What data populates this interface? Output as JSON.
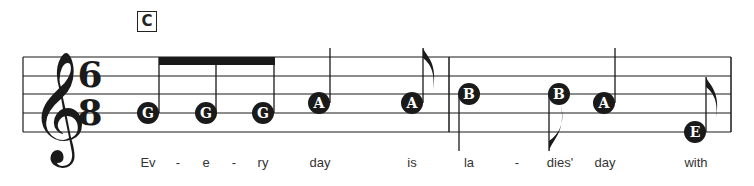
{
  "rehearsal_mark": "C",
  "clef": "treble",
  "time_signature": {
    "top": "6",
    "bottom": "8"
  },
  "colors": {
    "ink": "#1a1a1a",
    "note_text": "#ffffff",
    "lyric": "#333333"
  },
  "measures": [
    {
      "notes": [
        {
          "letter": "G",
          "duration": "eighth",
          "beamed": true,
          "x": 148,
          "y": 113,
          "lyric": "Ev"
        },
        {
          "letter": "G",
          "duration": "eighth",
          "beamed": true,
          "x": 206,
          "y": 113,
          "lyric": "e"
        },
        {
          "letter": "G",
          "duration": "eighth",
          "beamed": true,
          "x": 263,
          "y": 113,
          "lyric": "ry"
        },
        {
          "letter": "A",
          "duration": "quarter",
          "x": 319,
          "y": 103,
          "lyric": "day"
        },
        {
          "letter": "A",
          "duration": "eighth",
          "x": 412,
          "y": 103,
          "lyric": "is"
        }
      ]
    },
    {
      "notes": [
        {
          "letter": "B",
          "duration": "quarter",
          "stem": "down",
          "x": 469,
          "y": 94,
          "lyric": "la"
        },
        {
          "letter": "B",
          "duration": "eighth",
          "stem": "down",
          "x": 559,
          "y": 94,
          "lyric": "dies'"
        },
        {
          "letter": "A",
          "duration": "quarter",
          "x": 604,
          "y": 103,
          "lyric": "day"
        },
        {
          "letter": "E",
          "duration": "eighth",
          "x": 695,
          "y": 132,
          "lyric": "with"
        }
      ]
    }
  ],
  "lyrics": [
    {
      "text": "Ev",
      "x": 148
    },
    {
      "text": "-",
      "x": 178
    },
    {
      "text": "e",
      "x": 206
    },
    {
      "text": "-",
      "x": 234
    },
    {
      "text": "ry",
      "x": 263
    },
    {
      "text": "day",
      "x": 320
    },
    {
      "text": "is",
      "x": 412
    },
    {
      "text": "la",
      "x": 469
    },
    {
      "text": "-",
      "x": 517
    },
    {
      "text": "dies'",
      "x": 560
    },
    {
      "text": "day",
      "x": 605
    },
    {
      "text": "with",
      "x": 696
    }
  ]
}
